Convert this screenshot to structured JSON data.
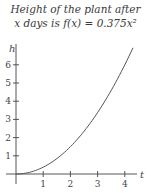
{
  "chart_data": {
    "type": "line",
    "title_line1": "Height of the plant after",
    "title_line2": "x days is f(x) = 0.375x²",
    "xlabel": "t",
    "ylabel": "h",
    "xticks": [
      "1",
      "2",
      "3",
      "4"
    ],
    "yticks": [
      "1",
      "2",
      "3",
      "4",
      "5",
      "6"
    ],
    "xlim": [
      0,
      4.4
    ],
    "ylim": [
      0,
      7
    ],
    "grid": false,
    "function": "f(x) = 0.375x^2",
    "series": [
      {
        "name": "f(x) = 0.375x^2",
        "x": [
          0,
          0.5,
          1,
          1.5,
          2,
          2.5,
          3,
          3.5,
          4,
          4.3
        ],
        "y": [
          0,
          0.094,
          0.375,
          0.844,
          1.5,
          2.344,
          3.375,
          4.594,
          6.0,
          6.93
        ]
      }
    ]
  }
}
